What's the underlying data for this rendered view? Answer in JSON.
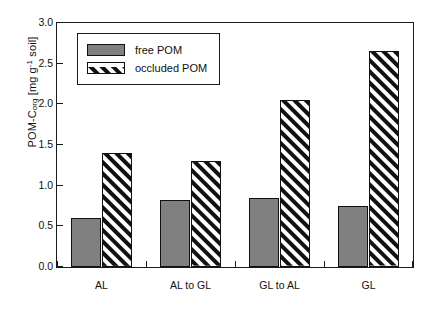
{
  "chart_data": {
    "type": "bar",
    "title": "",
    "subtitle": "",
    "xlabel": "",
    "ylabel": "POM-Corg [mg g-1 soil]",
    "ylabel_parts": {
      "main": "POM-C",
      "subscript": "org",
      "unit_pre": " [mg g",
      "superscript": "-1",
      "unit_post": " soil]"
    },
    "categories": [
      "AL",
      "AL to GL",
      "GL to AL",
      "GL"
    ],
    "series": [
      {
        "name": "free POM",
        "key": "free",
        "values": [
          0.6,
          0.83,
          0.85,
          0.75
        ],
        "color": "#808080",
        "pattern": "solid"
      },
      {
        "name": "occluded POM",
        "key": "occluded",
        "values": [
          1.4,
          1.3,
          2.05,
          2.65
        ],
        "color": "#ffffff",
        "pattern": "diagonal-hatch"
      }
    ],
    "ylim": [
      0.0,
      3.0
    ],
    "ytick_values": [
      0.0,
      0.5,
      1.0,
      1.5,
      2.0,
      2.5,
      3.0
    ],
    "ytick_labels": [
      "0.0",
      "0.5",
      "1.0",
      "1.5",
      "2.0",
      "2.5",
      "3.0"
    ],
    "grid": false,
    "legend_position": "top-left",
    "frame": "box",
    "axis_color": "#1a1a1a"
  },
  "legend": {
    "entries": [
      {
        "label": "free POM"
      },
      {
        "label": "occluded POM"
      }
    ]
  }
}
